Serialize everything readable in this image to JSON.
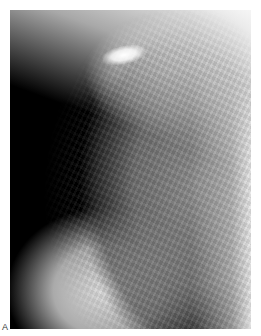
{
  "figure": {
    "panel_label": "A"
  }
}
